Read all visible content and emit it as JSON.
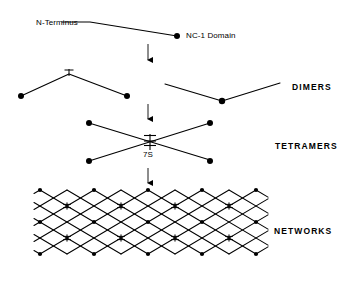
{
  "diagram": {
    "background_color": "#ffffff",
    "stroke_color": "#000000",
    "stages": [
      {
        "id": "monomer",
        "label": ""
      },
      {
        "id": "dimers",
        "label": "DIMERS"
      },
      {
        "id": "tetramers",
        "label": "TETRAMERS"
      },
      {
        "id": "networks",
        "label": "NETWORKS"
      }
    ],
    "annotations": {
      "n_terminus": "N-Terminus",
      "nc1_domain": "NC-1 Domain",
      "seven_s": "7S"
    },
    "arrows": [
      {
        "id": "arrow-monomer-to-dimers",
        "x": 148,
        "y1": 44,
        "y2": 66
      },
      {
        "id": "arrow-dimers-to-tetramers",
        "x": 148,
        "y1": 104,
        "y2": 124
      },
      {
        "id": "arrow-tetramers-to-networks",
        "x": 148,
        "y1": 168,
        "y2": 188
      }
    ],
    "monomer": {
      "polyline": "62,22 90,22 177,36",
      "nc1_dot": {
        "cx": 177,
        "cy": 36,
        "r": 3.0
      }
    },
    "dimer_left": {
      "polyline": "21,96 69,74 127,96",
      "dots": [
        {
          "cx": 21,
          "cy": 96,
          "r": 3.0
        },
        {
          "cx": 127,
          "cy": 96,
          "r": 3.0
        }
      ],
      "crossbar": {
        "x": 69,
        "y": 71,
        "half_width": 4.5,
        "height": 5
      }
    },
    "dimer_right": {
      "polyline": "165,84 222,101 280,83",
      "dot": {
        "cx": 222,
        "cy": 101,
        "r": 3.0
      }
    },
    "tetramer": {
      "strand_a": "89,123 210,160",
      "strand_b": "89,161 210,123",
      "dots": [
        {
          "cx": 89,
          "cy": 123,
          "r": 3.0
        },
        {
          "cx": 210,
          "cy": 123,
          "r": 3.0
        },
        {
          "cx": 89,
          "cy": 161,
          "r": 3.0
        },
        {
          "cx": 210,
          "cy": 161,
          "r": 3.0
        }
      ],
      "seven_s_node": {
        "cx": 150,
        "cy": 142,
        "bars": 3,
        "half_width": 6,
        "spacing": 4
      }
    },
    "network": {
      "origin_x": 40,
      "origin_y": 190,
      "cell_width": 54,
      "cell_half_height": 16,
      "columns": 4,
      "rows": 4,
      "node_kinds": [
        "seven-s-junction",
        "dot-junction"
      ]
    },
    "colors": {
      "ink": "#000000",
      "paper": "#ffffff"
    }
  }
}
